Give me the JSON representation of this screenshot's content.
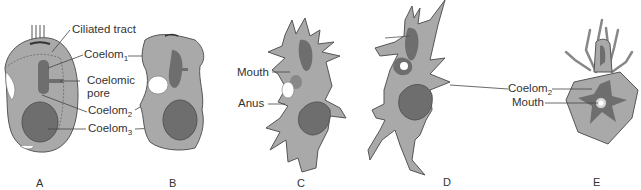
{
  "figure": {
    "panels": [
      {
        "id": "A",
        "label": "A",
        "labels": [
          {
            "text": "Ciliated tract",
            "sub": ""
          },
          {
            "text": "Coelom",
            "sub": "1"
          },
          {
            "text": "Coelomic",
            "sub": ""
          },
          {
            "text": "pore",
            "sub": ""
          },
          {
            "text": "Coelom",
            "sub": "2"
          },
          {
            "text": "Coelom",
            "sub": "3"
          }
        ]
      },
      {
        "id": "B",
        "label": "B",
        "labels": []
      },
      {
        "id": "C",
        "label": "C",
        "labels": [
          {
            "text": "Mouth",
            "sub": ""
          },
          {
            "text": "Anus",
            "sub": ""
          }
        ]
      },
      {
        "id": "D",
        "label": "D",
        "labels": []
      },
      {
        "id": "E",
        "label": "E",
        "labels": [
          {
            "text": "Coelom",
            "sub": "2"
          },
          {
            "text": "Mouth",
            "sub": ""
          }
        ]
      }
    ],
    "colors": {
      "body_fill": "#a9a9a9",
      "organ_fill": "#6e6e6e",
      "outline": "#555555",
      "background": "#ffffff",
      "text": "#333333"
    }
  }
}
